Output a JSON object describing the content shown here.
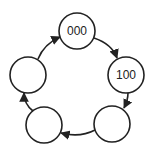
{
  "diagram": {
    "type": "state-cycle",
    "stroke_color": "#222222",
    "background": "#ffffff",
    "nodes": [
      {
        "id": "top",
        "label": "000",
        "cx": 77,
        "cy": 31,
        "r": 18
      },
      {
        "id": "right",
        "label": "100",
        "cx": 126,
        "cy": 75,
        "r": 18
      },
      {
        "id": "bottom-right",
        "label": "",
        "cx": 112,
        "cy": 124,
        "r": 18
      },
      {
        "id": "bottom-left",
        "label": "",
        "cx": 44,
        "cy": 125,
        "r": 18
      },
      {
        "id": "left",
        "label": "",
        "cx": 28,
        "cy": 75,
        "r": 18
      }
    ],
    "edges": [
      {
        "from": "top",
        "to": "right"
      },
      {
        "from": "right",
        "to": "bottom-right"
      },
      {
        "from": "bottom-right",
        "to": "bottom-left"
      },
      {
        "from": "bottom-left",
        "to": "left"
      },
      {
        "from": "left",
        "to": "top"
      }
    ]
  }
}
